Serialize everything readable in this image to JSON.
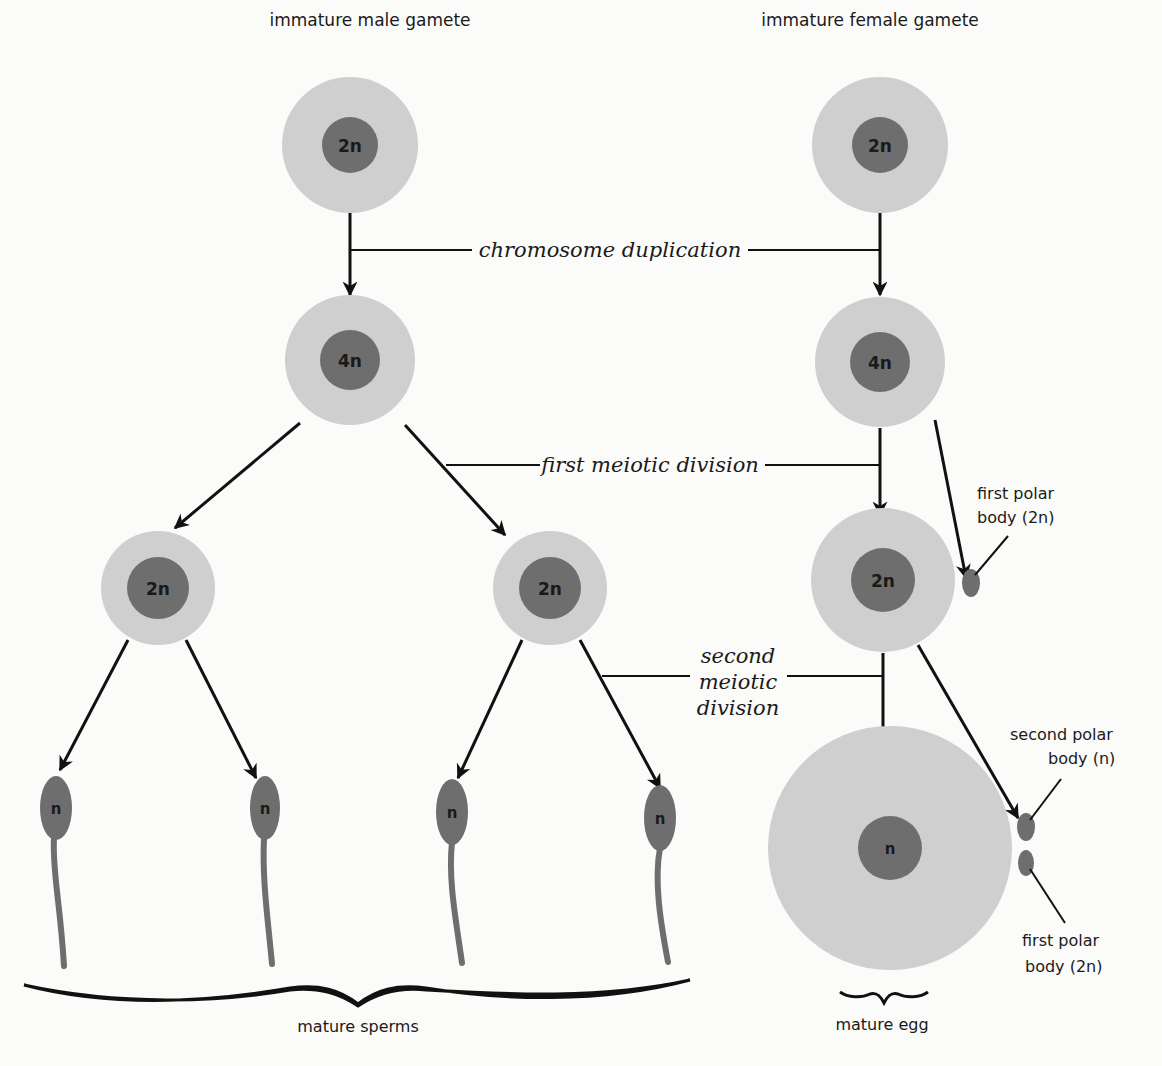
{
  "diagram": {
    "title_left": "immature male gamete",
    "title_right": "immature female gamete",
    "stages": {
      "duplication": "chromosome duplication",
      "first_division": "first meiotic division",
      "second_division_line1": "second",
      "second_division_line2": "meiotic",
      "second_division_line3": "division"
    },
    "cells": {
      "male_immature": "2n",
      "male_duplicated": "4n",
      "male_secondary_left": "2n",
      "male_secondary_right": "2n",
      "sperm_1": "n",
      "sperm_2": "n",
      "sperm_3": "n",
      "sperm_4": "n",
      "female_immature": "2n",
      "female_duplicated": "4n",
      "female_secondary": "2n",
      "egg": "n"
    },
    "labels": {
      "first_polar_body_top_line1": "first polar",
      "first_polar_body_top_line2": "body (2n)",
      "second_polar_body_line1": "second polar",
      "second_polar_body_line2": "body (n)",
      "first_polar_body_bottom_line1": "first polar",
      "first_polar_body_bottom_line2": "body (2n)",
      "mature_sperms": "mature sperms",
      "mature_egg": "mature egg"
    },
    "colors": {
      "cytoplasm": "#cfcfcf",
      "nucleus": "#6e6e6e",
      "lines": "#111111",
      "background": "#fbfbf9"
    }
  }
}
